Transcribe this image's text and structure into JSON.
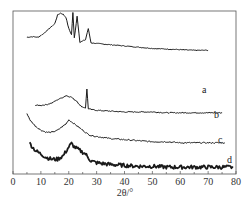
{
  "chart_data": {
    "type": "line",
    "title": "",
    "xlabel": "2θ/°",
    "ylabel": "",
    "xlim": [
      0,
      80
    ],
    "x_ticks": [
      0,
      10,
      20,
      30,
      40,
      50,
      60,
      70,
      80
    ],
    "grid": false,
    "legend": "inline labels at right end of each curve",
    "series": [
      {
        "name": "a",
        "x": [
          5,
          7,
          9,
          11,
          13,
          15,
          16,
          17,
          18,
          19,
          20,
          21,
          21.5,
          22,
          23,
          24,
          25,
          26,
          27,
          28,
          30,
          35,
          40,
          45,
          50,
          55,
          60,
          65,
          70
        ],
        "values": [
          56,
          57,
          56,
          62,
          70,
          78,
          92,
          95,
          93,
          88,
          70,
          60,
          96,
          55,
          90,
          48,
          50,
          52,
          70,
          47,
          46,
          44,
          42,
          40,
          38,
          37,
          36,
          35,
          35
        ],
        "label_pos": [
          70,
          90
        ]
      },
      {
        "name": "b",
        "x": [
          8,
          10,
          12,
          14,
          16,
          18,
          19,
          20,
          21,
          22,
          23,
          24,
          25,
          26,
          26.5,
          27,
          28,
          30,
          35,
          40,
          45,
          50,
          55,
          60,
          65,
          70,
          75
        ],
        "values": [
          30,
          30,
          31,
          33,
          37,
          40,
          42,
          41,
          40,
          37,
          35,
          30,
          28,
          27,
          50,
          26,
          25,
          24,
          23,
          22,
          22,
          22,
          21,
          21,
          21,
          21,
          21
        ],
        "label_pos": [
          74,
          115
        ]
      },
      {
        "name": "c",
        "x": [
          5,
          6,
          8,
          10,
          12,
          14,
          16,
          18,
          19,
          20,
          21,
          22,
          24,
          25,
          26,
          27,
          28,
          30,
          35,
          40,
          45,
          50,
          55,
          60,
          65,
          70,
          76
        ],
        "values": [
          32,
          26,
          20,
          16,
          14,
          14,
          16,
          20,
          22,
          26,
          24,
          22,
          18,
          16,
          14,
          12,
          11,
          10,
          8,
          7,
          6,
          5,
          5,
          4,
          4,
          4,
          4
        ],
        "label_pos": [
          76,
          140
        ]
      },
      {
        "name": "d",
        "x": [
          6,
          8,
          10,
          12,
          14,
          16,
          18,
          20,
          21,
          22,
          24,
          26,
          27,
          28,
          30,
          35,
          40,
          45,
          50,
          55,
          60,
          65,
          70,
          75,
          79
        ],
        "values": [
          14,
          10,
          8,
          6,
          5,
          5,
          7,
          12,
          14,
          12,
          10,
          8,
          6,
          4,
          3,
          2,
          1.5,
          1,
          1,
          0.5,
          0.5,
          0.5,
          0.5,
          0.5,
          0.5
        ],
        "label_pos": [
          78,
          160
        ]
      }
    ],
    "annotations": [
      "a",
      "b",
      "c",
      "d"
    ]
  },
  "axis": {
    "xlabel": "2θ/°",
    "tick_labels": [
      "0",
      "10",
      "20",
      "30",
      "40",
      "50",
      "60",
      "70",
      "80"
    ]
  },
  "labels": {
    "a": "a",
    "b": "b",
    "c": "c",
    "d": "d"
  },
  "colors": {
    "line": "#1a1a1a",
    "frame": "#555555",
    "background": "#ffffff"
  }
}
